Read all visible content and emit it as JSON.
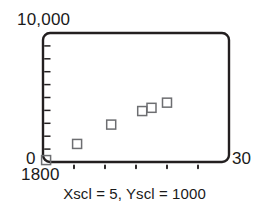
{
  "figure": {
    "kind": "scatter-plot",
    "y_axis_max_label": "10,000",
    "y_axis_origin_label": "0",
    "x_axis_min_label": "1800",
    "x_axis_max_label": "30",
    "caption": "Xscl = 5, Yscl = 1000"
  },
  "chart_data": {
    "type": "scatter",
    "title": "",
    "subtitle": "",
    "xlabel": "",
    "ylabel": "",
    "annotations": [
      "Xscl = 5, Yscl = 1000"
    ],
    "grid": false,
    "legend": null,
    "xlim": [
      1800,
      1830
    ],
    "ylim": [
      0,
      10000
    ],
    "x_tick_labels": [
      "1800",
      "30"
    ],
    "y_tick_labels": [
      "0",
      "10,000"
    ],
    "x_scale_interval": 5,
    "y_scale_interval": 1000,
    "x_ticks": [
      1805,
      1810,
      1815,
      1820,
      1825
    ],
    "y_ticks": [
      1000,
      2000,
      3000,
      4000,
      5000,
      6000,
      7000,
      8000,
      9000
    ],
    "marker": "open-square",
    "series": [
      {
        "name": "data",
        "x": [
          1800.5,
          1805.5,
          1811,
          1816,
          1817.5,
          1820
        ],
        "y": [
          150,
          1400,
          2900,
          3950,
          4200,
          4600
        ]
      }
    ]
  },
  "plot_geometry": {
    "left": 43,
    "right": 229,
    "top": 33,
    "bottom": 162,
    "corner_radius": 7,
    "frame_color": "#231f20",
    "marker_color": "#6d6e71",
    "marker_size": 9
  }
}
